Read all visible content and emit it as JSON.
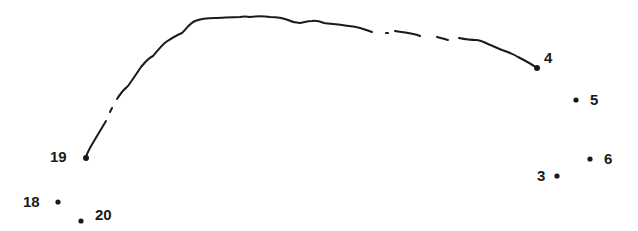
{
  "puzzle": {
    "type": "connect-the-dots",
    "stroke_color": "#1a1a1a",
    "background_color": "#ffffff",
    "dots": [
      {
        "number": "3",
        "x": 557,
        "y": 176,
        "label_x": 537,
        "label_y": 168
      },
      {
        "number": "4",
        "x": 537,
        "y": 68,
        "label_x": 544,
        "label_y": 50
      },
      {
        "number": "5",
        "x": 576,
        "y": 100,
        "label_x": 590,
        "label_y": 92
      },
      {
        "number": "6",
        "x": 590,
        "y": 159,
        "label_x": 604,
        "label_y": 151
      },
      {
        "number": "18",
        "x": 58,
        "y": 202,
        "label_x": 23,
        "label_y": 194
      },
      {
        "number": "19",
        "x": 86,
        "y": 158,
        "label_x": 50,
        "label_y": 149
      },
      {
        "number": "20",
        "x": 81,
        "y": 221,
        "label_x": 95,
        "label_y": 207
      }
    ],
    "drawn_path": {
      "from_dot": "19",
      "to_dot": "4",
      "description": "hand-drawn wavy arc connecting dot 19 to dot 4 with small gaps"
    }
  }
}
